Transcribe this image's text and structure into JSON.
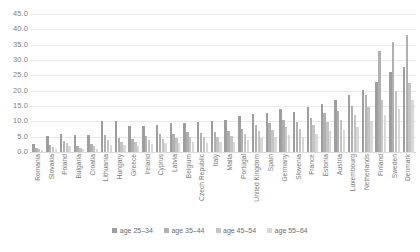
{
  "chart_data": {
    "type": "bar",
    "title": "",
    "subtitle": "",
    "xlabel": "",
    "ylabel": "",
    "ylim": [
      0,
      45
    ],
    "ytick_step": 5,
    "grid": true,
    "legend_position": "bottom",
    "yticks": [
      "0.0",
      "5.0",
      "10.0",
      "15.0",
      "20.0",
      "25.0",
      "30.0",
      "35.0",
      "40.0",
      "45.0"
    ],
    "categories": [
      "Romania",
      "Slovakia",
      "Poland",
      "Bulgaria",
      "Croatia",
      "Lithuania",
      "Hungary",
      "Greece",
      "Ireland",
      "Cyprus",
      "Latvia",
      "Belgium",
      "Czech Republic",
      "Italy",
      "Malta",
      "Portugal",
      "United Kingdom",
      "Spain",
      "Germany",
      "Slovenia",
      "France",
      "Estonia",
      "Austria",
      "Luxembourg",
      "Netherlands",
      "Finland",
      "Sweden",
      "Denmark"
    ],
    "series": [
      {
        "name": "age 25–34",
        "color": "#9e9e9e",
        "values": [
          2.6,
          5.3,
          6.0,
          5.5,
          5.6,
          10.0,
          10.2,
          8.4,
          8.5,
          8.8,
          9.3,
          9.6,
          9.8,
          10.2,
          10.4,
          11.6,
          12.3,
          12.6,
          14.0,
          13.0,
          14.6,
          15.8,
          17.0,
          18.6,
          20.3,
          22.8,
          26.2,
          27.8
        ]
      },
      {
        "name": "age 35–44",
        "color": "#b0b0b0",
        "values": [
          1.2,
          2.4,
          3.6,
          2.0,
          2.6,
          5.4,
          4.6,
          4.2,
          5.2,
          5.8,
          6.0,
          6.4,
          6.2,
          6.6,
          6.8,
          7.6,
          8.8,
          9.4,
          10.6,
          9.8,
          11.2,
          12.6,
          13.4,
          15.0,
          18.6,
          33.0,
          36.0,
          38.2
        ]
      },
      {
        "name": "age 45–54",
        "color": "#c4c4c4",
        "values": [
          0.9,
          1.6,
          2.8,
          1.4,
          1.8,
          3.8,
          3.4,
          3.2,
          4.0,
          4.4,
          4.6,
          4.8,
          4.8,
          5.0,
          5.2,
          6.0,
          6.8,
          7.2,
          8.2,
          7.6,
          8.8,
          9.8,
          10.6,
          12.0,
          14.6,
          17.0,
          20.0,
          22.6
        ]
      },
      {
        "name": "age 55–64",
        "color": "#d8d8d8",
        "values": [
          0.6,
          1.0,
          1.8,
          0.9,
          1.1,
          2.4,
          2.2,
          2.0,
          2.6,
          2.8,
          3.0,
          3.2,
          3.0,
          3.4,
          3.4,
          4.0,
          4.6,
          4.8,
          5.6,
          5.0,
          6.0,
          6.8,
          7.2,
          8.2,
          10.0,
          12.0,
          14.0,
          16.8
        ]
      }
    ]
  }
}
